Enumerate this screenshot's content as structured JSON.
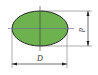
{
  "diagram": {
    "shape": "ellipse",
    "fill_color": "#6db24f",
    "stroke_color": "#2a2a2a",
    "labels": {
      "major_axis": "D",
      "minor_axis": "d"
    }
  }
}
